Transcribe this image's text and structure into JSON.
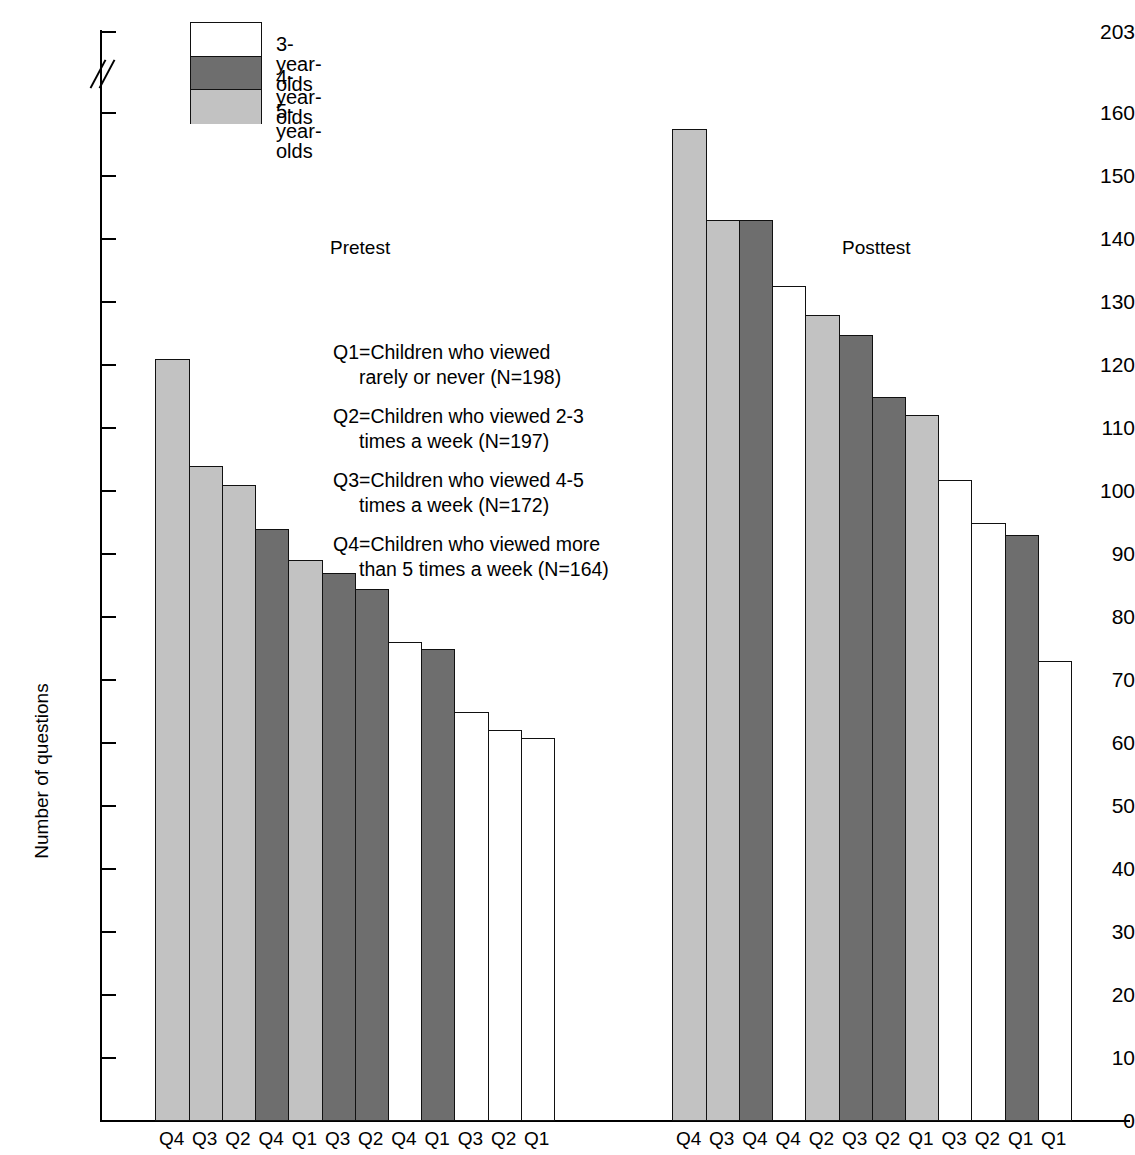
{
  "chart_data": {
    "type": "bar",
    "title": "",
    "xlabel": "",
    "ylabel": "Number of questions",
    "ylim": [
      0,
      203
    ],
    "axis_break": {
      "from": 160,
      "to": 203,
      "present": true
    },
    "grid": false,
    "y_ticks": [
      0,
      10,
      20,
      30,
      40,
      50,
      60,
      70,
      80,
      90,
      100,
      110,
      120,
      130,
      140,
      150,
      160,
      203
    ],
    "legend": {
      "position": "top-left",
      "entries": [
        {
          "label": "3-year-olds",
          "fill": "white",
          "color": "#ffffff"
        },
        {
          "label": "4-year-olds",
          "fill": "dark-gray",
          "color": "#6e6e6e"
        },
        {
          "label": "5-year-olds",
          "fill": "light-gray",
          "color": "#c2c2c2"
        }
      ]
    },
    "groups": [
      {
        "name": "Pretest",
        "bars": [
          {
            "category": "Q4",
            "series": "5-year-olds",
            "value": 121
          },
          {
            "category": "Q3",
            "series": "5-year-olds",
            "value": 104
          },
          {
            "category": "Q2",
            "series": "5-year-olds",
            "value": 101
          },
          {
            "category": "Q4",
            "series": "4-year-olds",
            "value": 94
          },
          {
            "category": "Q1",
            "series": "5-year-olds",
            "value": 89
          },
          {
            "category": "Q3",
            "series": "4-year-olds",
            "value": 87
          },
          {
            "category": "Q2",
            "series": "4-year-olds",
            "value": 84.5
          },
          {
            "category": "Q4",
            "series": "3-year-olds",
            "value": 76
          },
          {
            "category": "Q1",
            "series": "4-year-olds",
            "value": 75
          },
          {
            "category": "Q3",
            "series": "3-year-olds",
            "value": 65
          },
          {
            "category": "Q2",
            "series": "3-year-olds",
            "value": 62
          },
          {
            "category": "Q1",
            "series": "3-year-olds",
            "value": 60.8
          }
        ]
      },
      {
        "name": "Posttest",
        "bars": [
          {
            "category": "Q4",
            "series": "5-year-olds",
            "value": 157.5
          },
          {
            "category": "Q3",
            "series": "5-year-olds",
            "value": 143
          },
          {
            "category": "Q4",
            "series": "4-year-olds",
            "value": 143
          },
          {
            "category": "Q4",
            "series": "3-year-olds",
            "value": 132.5
          },
          {
            "category": "Q2",
            "series": "5-year-olds",
            "value": 128
          },
          {
            "category": "Q3",
            "series": "4-year-olds",
            "value": 124.8
          },
          {
            "category": "Q2",
            "series": "4-year-olds",
            "value": 115
          },
          {
            "category": "Q1",
            "series": "5-year-olds",
            "value": 112
          },
          {
            "category": "Q3",
            "series": "3-year-olds",
            "value": 101.8
          },
          {
            "category": "Q2",
            "series": "3-year-olds",
            "value": 95
          },
          {
            "category": "Q1",
            "series": "4-year-olds",
            "value": 93
          },
          {
            "category": "Q1",
            "series": "3-year-olds",
            "value": 73
          }
        ]
      }
    ],
    "annotations": [
      {
        "key": "Q1",
        "line1": "Q1=Children who viewed",
        "line2": "rarely or never (N=198)"
      },
      {
        "key": "Q2",
        "line1": "Q2=Children who viewed 2-3",
        "line2": "times a week (N=197)"
      },
      {
        "key": "Q3",
        "line1": "Q3=Children who viewed 4-5",
        "line2": "times a week (N=172)"
      },
      {
        "key": "Q4",
        "line1": "Q4=Children who viewed more",
        "line2": "than 5 times a week (N=164)"
      }
    ]
  }
}
